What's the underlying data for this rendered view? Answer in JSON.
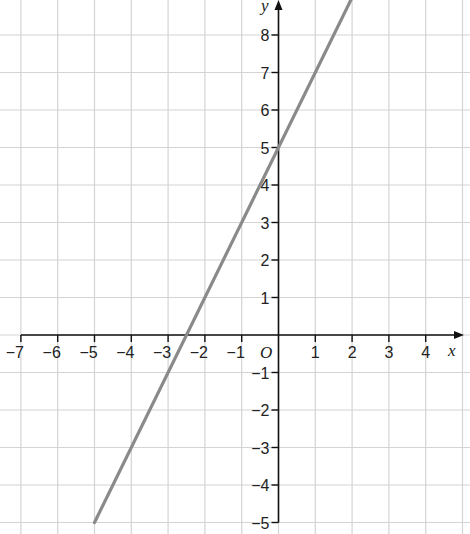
{
  "chart_data": {
    "type": "line",
    "title": "",
    "xlabel": "x",
    "ylabel": "y",
    "origin_label": "O",
    "xlim": [
      -7,
      5
    ],
    "ylim": [
      -5,
      9
    ],
    "grid": true,
    "x_ticks": [
      -7,
      -6,
      -5,
      -4,
      -3,
      -2,
      -1,
      1,
      2,
      3,
      4
    ],
    "y_ticks": [
      -5,
      -4,
      -3,
      -2,
      -1,
      1,
      2,
      3,
      4,
      5,
      6,
      7,
      8
    ],
    "series": [
      {
        "name": "y = 2x + 5",
        "x": [
          -5,
          2
        ],
        "y": [
          -5,
          9
        ],
        "color": "#8a8a8a"
      }
    ]
  },
  "axes": {
    "x_label": "x",
    "y_label": "y",
    "origin": "O"
  },
  "colors": {
    "grid": "#d4d4d4",
    "axis": "#111111",
    "line": "#8a8a8a"
  }
}
